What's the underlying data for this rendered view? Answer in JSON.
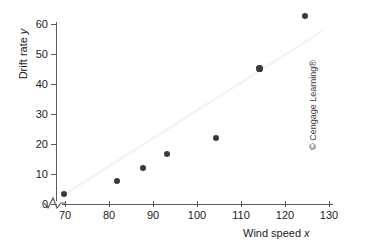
{
  "chart_data": {
    "type": "scatter",
    "title": "",
    "xlabel": "Wind speed",
    "xlabel_var": "x",
    "ylabel": "Drift rate",
    "ylabel_var": "y",
    "xlim": [
      67,
      131
    ],
    "ylim": [
      0,
      63
    ],
    "grid": false,
    "legend": null,
    "x_ticks": [
      70,
      80,
      90,
      100,
      110,
      120,
      130
    ],
    "y_ticks": [
      0,
      10,
      20,
      30,
      40,
      50,
      60
    ],
    "axis_break_x": true,
    "point_color": "#3a3a3a",
    "axis_color": "#5b5b5b",
    "x": [
      69.7,
      81.8,
      87.8,
      93.1,
      104.4,
      114.2,
      124.6
    ],
    "y": [
      3.2,
      7.4,
      11.8,
      16.4,
      21.8,
      45.0,
      62.5
    ],
    "points": [
      {
        "x": 69.7,
        "y": 3.2
      },
      {
        "x": 81.8,
        "y": 7.4
      },
      {
        "x": 87.8,
        "y": 11.8
      },
      {
        "x": 93.1,
        "y": 16.4
      },
      {
        "x": 104.4,
        "y": 21.8
      },
      {
        "x": 114.2,
        "y": 45.0
      },
      {
        "x": 124.6,
        "y": 62.5
      }
    ]
  },
  "credit": {
    "text": "© Cengage Learning®"
  }
}
